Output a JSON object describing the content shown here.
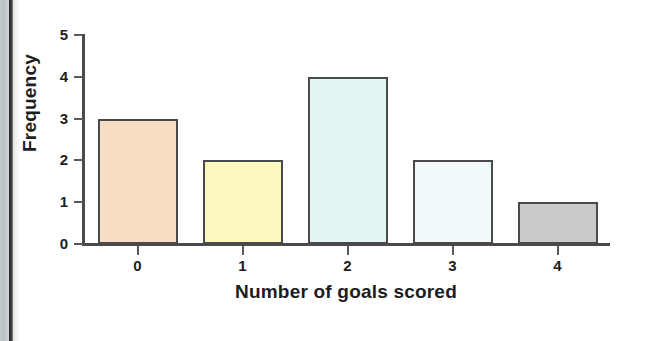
{
  "chart_data": {
    "type": "bar",
    "title": "",
    "xlabel": "Number of goals scored",
    "ylabel": "Frequency",
    "categories": [
      "0",
      "1",
      "2",
      "3",
      "4"
    ],
    "values": [
      3,
      2,
      4,
      2,
      1
    ],
    "ylim": [
      0,
      5
    ],
    "y_ticks": [
      "0",
      "1",
      "2",
      "3",
      "4",
      "5"
    ],
    "grid": false,
    "legend": null,
    "bar_colors": [
      "#f7ddc4",
      "#fcf8bd",
      "#e2f4f3",
      "#f2f9fa",
      "#c8cacb"
    ],
    "bar_outline_color": "#4a4a4c",
    "axis_color": "#4a4a4c",
    "text_color": "#1d1d1f",
    "background": "#ffffff"
  },
  "page_artifact": {
    "edge_strip_color": "#bfc6cb",
    "edge_line_color": "#2b2b2d"
  }
}
